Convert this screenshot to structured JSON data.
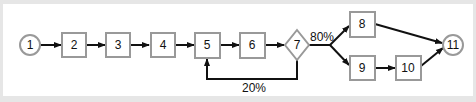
{
  "diagram": {
    "type": "process-flow",
    "colors": {
      "background": "#e6e6e6",
      "panel": "#ffffff",
      "node_stroke": "#999999",
      "edge_stroke": "#111111",
      "text": "#111111"
    },
    "nodes": [
      {
        "id": "1",
        "label": "1",
        "shape": "circle"
      },
      {
        "id": "2",
        "label": "2",
        "shape": "box"
      },
      {
        "id": "3",
        "label": "3",
        "shape": "box"
      },
      {
        "id": "4",
        "label": "4",
        "shape": "box"
      },
      {
        "id": "5",
        "label": "5",
        "shape": "box"
      },
      {
        "id": "6",
        "label": "6",
        "shape": "box"
      },
      {
        "id": "7",
        "label": "7",
        "shape": "diamond"
      },
      {
        "id": "8",
        "label": "8",
        "shape": "box"
      },
      {
        "id": "9",
        "label": "9",
        "shape": "box"
      },
      {
        "id": "10",
        "label": "10",
        "shape": "box"
      },
      {
        "id": "11",
        "label": "11",
        "shape": "circle"
      }
    ],
    "edges": [
      {
        "from": "1",
        "to": "2"
      },
      {
        "from": "2",
        "to": "3"
      },
      {
        "from": "3",
        "to": "4"
      },
      {
        "from": "4",
        "to": "5"
      },
      {
        "from": "5",
        "to": "6"
      },
      {
        "from": "6",
        "to": "7"
      },
      {
        "from": "7",
        "to": "8",
        "label": "80%"
      },
      {
        "from": "7",
        "to": "9",
        "label": "80%"
      },
      {
        "from": "7",
        "to": "5",
        "label": "20%"
      },
      {
        "from": "9",
        "to": "10"
      },
      {
        "from": "8",
        "to": "11"
      },
      {
        "from": "10",
        "to": "11"
      }
    ],
    "edge_labels": {
      "forward_branch": "80%",
      "feedback": "20%"
    }
  }
}
